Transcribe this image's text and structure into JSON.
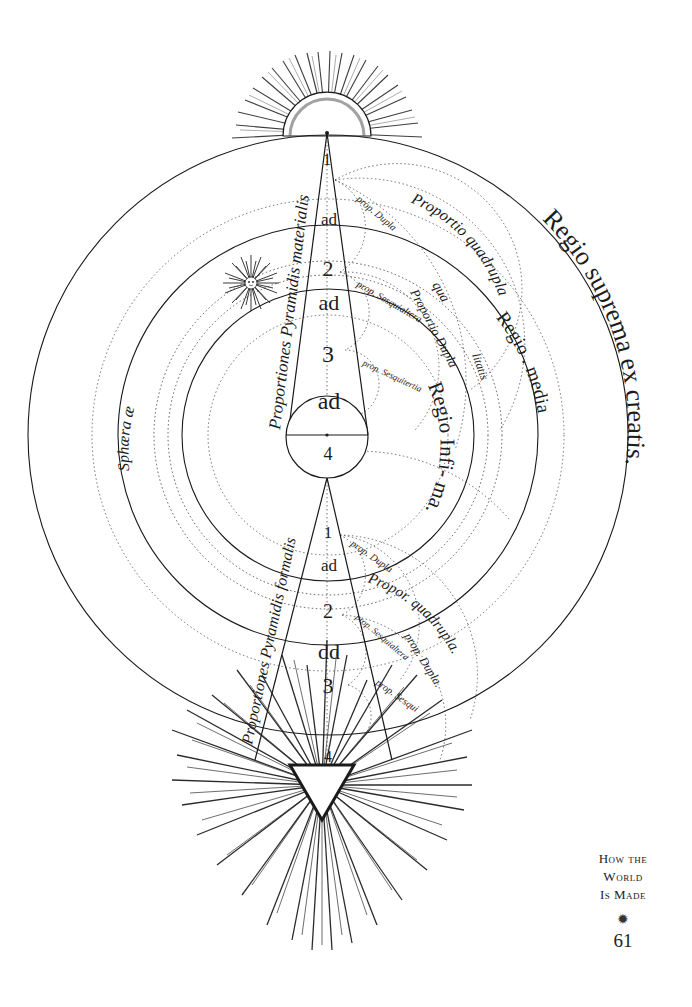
{
  "engraving": {
    "upper_pyramid": {
      "label": "Proportiones Pyramidis materialis",
      "levels": [
        "1",
        "ad",
        "2",
        "ad",
        "3",
        "ad",
        "4"
      ]
    },
    "lower_pyramid": {
      "label": "Proportiones Pyramidis formalis",
      "levels": [
        "1",
        "ad",
        "2",
        "dd",
        "3",
        "4"
      ]
    },
    "regions": {
      "outer": "Regio suprema ex creatis.",
      "middle": "Regio . media",
      "inner": "Regio Infi- ma."
    },
    "sphere_label": "Sphæra æ",
    "proportions": {
      "upper": [
        "Proportio quadrupla",
        "qua",
        "litatis",
        "Proportio Dupla",
        "prop. Dupla",
        "prop. Sesquialtera",
        "prop. Sesquitertia"
      ],
      "lower": [
        "Propor. quadrupla.",
        "prop. Dupla",
        "prop. Dupla.",
        "prop. Sesquialtera",
        "prop. Sesqui"
      ]
    }
  },
  "caption": {
    "line1": "How the",
    "line2": "World",
    "line3": "Is Made",
    "ornament": "✹",
    "page_number": "61"
  }
}
